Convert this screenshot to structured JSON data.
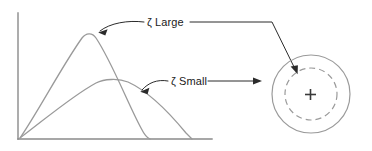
{
  "figure": {
    "type": "technical-diagram",
    "colors": {
      "background": "#ffffff",
      "axis": "#8a8a8a",
      "curve": "#9a9a9a",
      "circle": "#9a9a9a",
      "leader": "#2b2b2b",
      "text": "#1a1a1a",
      "plus": "#3a3a3a"
    },
    "plot": {
      "name": "response-curves-plot",
      "axes": {
        "y_axis_label": "",
        "x_axis_label": "",
        "y_axis": {
          "x": 18,
          "y_top": 13,
          "y_bottom": 139
        },
        "x_axis": {
          "y": 139,
          "x_left": 18,
          "x_right": 212
        }
      },
      "curves": [
        {
          "name": "zeta-large-curve",
          "label": "ζ Large",
          "peak_x": 89,
          "peak_y": 34,
          "start": [
            20,
            138
          ],
          "end": [
            150,
            139
          ],
          "style": "solid"
        },
        {
          "name": "zeta-small-curve",
          "label": "ζ Small",
          "peak_x": 113,
          "peak_y": 79,
          "start": [
            20,
            138
          ],
          "end": [
            192,
            139
          ],
          "style": "solid"
        }
      ]
    },
    "labels": [
      {
        "id": "label-zeta-large",
        "name": "zeta-large-label",
        "text": "ζ Large",
        "x": 147,
        "y": 16
      },
      {
        "id": "label-zeta-small",
        "name": "zeta-small-label",
        "text": "ζ Small",
        "x": 171,
        "y": 75
      }
    ],
    "leaders": [
      {
        "name": "zeta-large-curve-leader",
        "from": "zeta-large-label",
        "to": "zeta-large-curve-peak",
        "shape": "curved-arrow-left"
      },
      {
        "name": "zeta-large-target-leader",
        "from": "zeta-large-label",
        "to": "target-dashed-circle",
        "shape": "elbow-arrow-right-down"
      },
      {
        "name": "zeta-small-curve-leader",
        "from": "zeta-small-label",
        "to": "zeta-small-curve",
        "shape": "curved-arrow-left"
      },
      {
        "name": "zeta-small-target-leader",
        "from": "zeta-small-label",
        "to": "target-outer-circle",
        "shape": "straight-arrow-right"
      }
    ],
    "target": {
      "name": "target-diagram",
      "center": [
        311,
        94
      ],
      "outer_circle": {
        "name": "target-outer-circle",
        "radius": 39,
        "style": "solid"
      },
      "inner_circle": {
        "name": "target-dashed-circle",
        "radius": 26,
        "style": "dashed"
      },
      "center_mark": {
        "name": "target-center-cross",
        "glyph": "+",
        "size": 11
      }
    }
  }
}
